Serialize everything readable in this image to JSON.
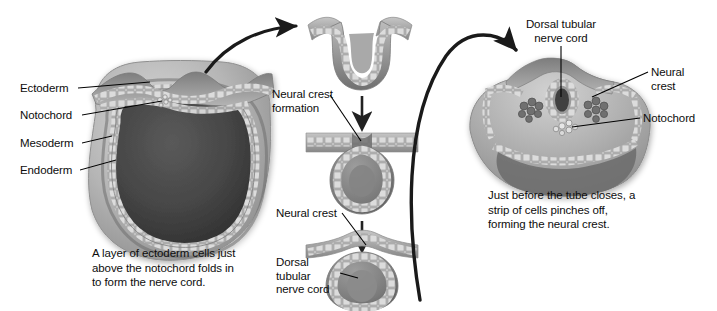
{
  "figure": {
    "background_color": "#ffffff",
    "ink_color": "#0d0d0d"
  },
  "left_panel": {
    "labels": {
      "ectoderm": "Ectoderm",
      "notochord": "Notochord",
      "mesoderm": "Mesoderm",
      "endoderm": "Endoderm"
    },
    "caption": "A layer of ectoderm cells just\nabove the notochord folds in\nto form the nerve cord."
  },
  "middle_panel": {
    "stage1_label": "",
    "neural_crest_formation": "Neural crest\nformation",
    "neural_crest": "Neural crest",
    "dorsal_tubular_nerve_cord": "Dorsal\ntubular\nnerve cord"
  },
  "right_panel": {
    "dorsal_tubular_nerve_cord": "Dorsal tubular\nnerve cord",
    "neural_crest": "Neural\ncrest",
    "notochord": "Notochord",
    "caption": "Just before the tube closes, a\nstrip of cells pinches off,\nforming the neural crest."
  },
  "colors": {
    "tissue_light": "#d8d8d8",
    "tissue_mid": "#a8a8a8",
    "tissue_dark": "#6e6e6e",
    "interior_dark": "#3a3a3a",
    "cell_fill": "#e6e6e6",
    "cell_stroke": "#8a8a8a",
    "arrow": "#1a1a1a",
    "leader": "#000000"
  },
  "icons": {
    "curved_arrow_left": "curved-arrow-icon",
    "curved_arrow_right": "curved-arrow-icon",
    "down_arrow": "down-arrow-icon"
  }
}
